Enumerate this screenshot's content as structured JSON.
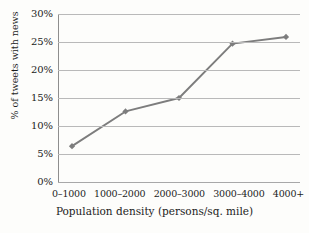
{
  "chart_data": {
    "type": "line",
    "title": "",
    "subtitle": "",
    "xlabel": "Population density (persons/sq. mile)",
    "ylabel": "% of tweets with news",
    "categories": [
      "0–1000",
      "1000–2000",
      "2000–3000",
      "3000–4000",
      "4000+"
    ],
    "values": [
      6.4,
      12.6,
      15.0,
      24.7,
      25.9
    ],
    "series": [
      {
        "name": "% of tweets with news",
        "values": [
          6.4,
          12.6,
          15.0,
          24.7,
          25.9
        ]
      }
    ],
    "ylim": [
      0,
      30
    ],
    "ytick_values": [
      0,
      5,
      10,
      15,
      20,
      25,
      30
    ],
    "ytick_labels": [
      "0%",
      "5%",
      "10%",
      "15%",
      "20%",
      "25%",
      "30%"
    ],
    "grid": "horizontal",
    "legend": "none",
    "marker": "diamond",
    "annotations": [],
    "colors": {
      "series_line": "#7d7d7d",
      "marker": "#7d7d7d",
      "gridline": "#b9b9b9",
      "axis": "#8e8e8e",
      "text": "#1c1c1c",
      "background": "#fdfdfb"
    }
  }
}
